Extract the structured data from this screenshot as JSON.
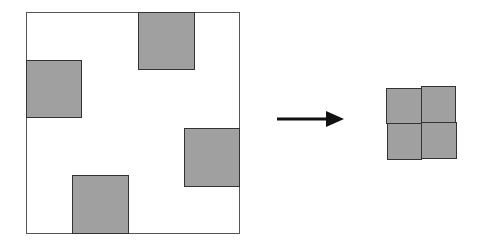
{
  "diagram": {
    "colors": {
      "square_fill": "#a0a0a0",
      "square_border": "#333333",
      "frame_border": "#555555",
      "arrow": "#111111"
    },
    "left_panel": {
      "frame": {
        "x": 26,
        "y": 12,
        "w": 214,
        "h": 222
      },
      "squares": [
        {
          "name": "top",
          "x": 138,
          "y": 12,
          "w": 57,
          "h": 58
        },
        {
          "name": "left",
          "x": 26,
          "y": 60,
          "w": 56,
          "h": 58
        },
        {
          "name": "right",
          "x": 184,
          "y": 128,
          "w": 56,
          "h": 59
        },
        {
          "name": "bottom",
          "x": 72,
          "y": 175,
          "w": 57,
          "h": 59
        }
      ]
    },
    "arrow": {
      "x1": 277,
      "x2": 343,
      "y": 119,
      "direction": "right"
    },
    "right_panel": {
      "grid": "2x2",
      "squares": [
        {
          "x": 386,
          "y": 88,
          "w": 36,
          "h": 36
        },
        {
          "x": 421,
          "y": 86,
          "w": 35,
          "h": 37
        },
        {
          "x": 387,
          "y": 123,
          "w": 35,
          "h": 37
        },
        {
          "x": 421,
          "y": 122,
          "w": 36,
          "h": 37
        }
      ]
    }
  }
}
